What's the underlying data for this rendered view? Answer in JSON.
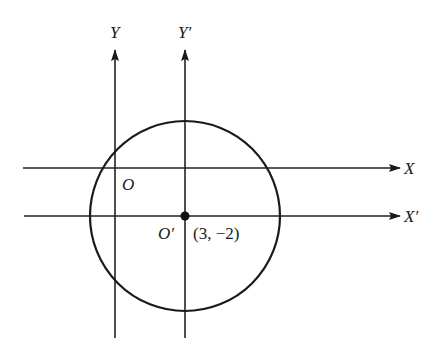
{
  "diagram": {
    "labels": {
      "y_axis": "Y",
      "y_prime_axis": "Y′",
      "x_axis": "X",
      "x_prime_axis": "X′",
      "origin": "O",
      "new_origin": "O′",
      "new_origin_coords": "(3, −2)"
    },
    "colors": {
      "stroke": "#1a1a1a",
      "background": "#ffffff"
    },
    "geometry": {
      "circle_center": [
        185,
        216
      ],
      "circle_radius": 95,
      "x_axis_y": 168,
      "x_prime_axis_y": 216,
      "y_axis_x": 115,
      "y_prime_axis_x": 185
    }
  }
}
